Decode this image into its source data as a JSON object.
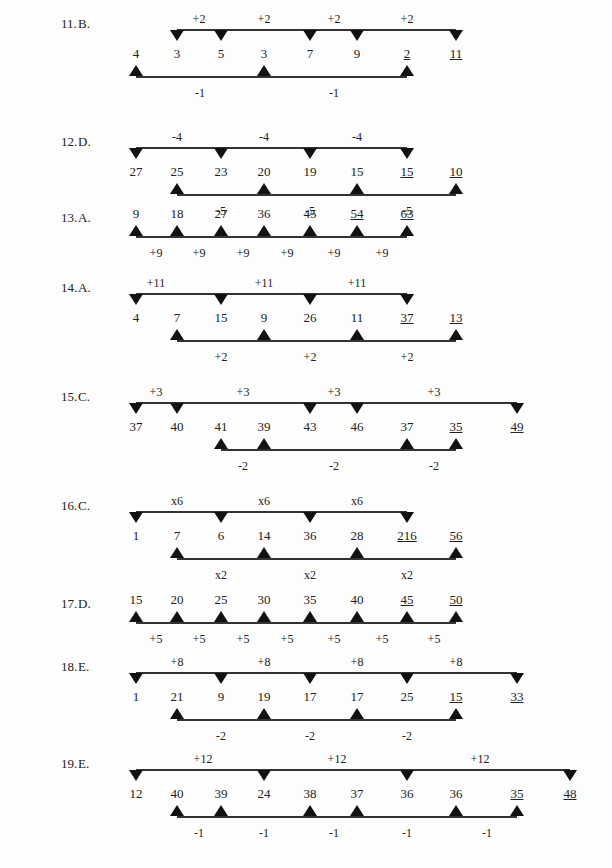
{
  "problems": [
    {
      "number": "11.",
      "answer": "B.",
      "y_top": 12,
      "sequence": [
        {
          "v": "4",
          "x": 136
        },
        {
          "v": "3",
          "x": 177
        },
        {
          "v": "5",
          "x": 221
        },
        {
          "v": "3",
          "x": 264
        },
        {
          "v": "7",
          "x": 310
        },
        {
          "v": "9",
          "x": 357
        },
        {
          "v": "2",
          "x": 407,
          "u": true
        },
        {
          "v": "11",
          "x": 456,
          "u": true
        }
      ],
      "top_line": {
        "x1": 177,
        "x2": 456,
        "markers": [
          177,
          221,
          310,
          357,
          456
        ],
        "labels": [
          {
            "t": "+2",
            "x": 199
          },
          {
            "t": "+2",
            "x": 264
          },
          {
            "t": "+2",
            "x": 334
          },
          {
            "t": "+2",
            "x": 407
          }
        ]
      },
      "bottom_line": {
        "x1": 136,
        "x2": 407,
        "markers": [
          136,
          264,
          407
        ],
        "labels": [
          {
            "t": "-1",
            "x": 200
          },
          {
            "t": "-1",
            "x": 334
          }
        ]
      }
    },
    {
      "number": "12.",
      "answer": "D.",
      "y_top": 130,
      "sequence": [
        {
          "v": "27",
          "x": 136
        },
        {
          "v": "25",
          "x": 177
        },
        {
          "v": "23",
          "x": 221
        },
        {
          "v": "20",
          "x": 264
        },
        {
          "v": "19",
          "x": 310
        },
        {
          "v": "15",
          "x": 357
        },
        {
          "v": "15",
          "x": 407,
          "u": true
        },
        {
          "v": "10",
          "x": 456,
          "u": true
        }
      ],
      "top_line": {
        "x1": 136,
        "x2": 407,
        "markers": [
          136,
          221,
          310,
          407
        ],
        "labels": [
          {
            "t": "-4",
            "x": 177
          },
          {
            "t": "-4",
            "x": 264
          },
          {
            "t": "-4",
            "x": 357
          }
        ]
      },
      "bottom_line": {
        "x1": 177,
        "x2": 456,
        "markers": [
          177,
          264,
          357,
          456
        ],
        "labels": [
          {
            "t": "-5",
            "x": 221
          },
          {
            "t": "-5",
            "x": 310
          },
          {
            "t": "-5",
            "x": 407
          }
        ]
      }
    },
    {
      "number": "13.",
      "answer": "A.",
      "y_top": 206,
      "simple": true,
      "sequence": [
        {
          "v": "9",
          "x": 136
        },
        {
          "v": "18",
          "x": 177
        },
        {
          "v": "27",
          "x": 221
        },
        {
          "v": "36",
          "x": 264
        },
        {
          "v": "45",
          "x": 310
        },
        {
          "v": "54",
          "x": 357,
          "u": true
        },
        {
          "v": "63",
          "x": 407,
          "u": true
        }
      ],
      "bottom_line": {
        "x1": 136,
        "x2": 407,
        "markers": [
          136,
          177,
          221,
          264,
          310,
          357,
          407
        ],
        "labels": [
          {
            "t": "+9",
            "x": 156
          },
          {
            "t": "+9",
            "x": 199
          },
          {
            "t": "+9",
            "x": 243
          },
          {
            "t": "+9",
            "x": 287
          },
          {
            "t": "+9",
            "x": 334
          },
          {
            "t": "+9",
            "x": 382
          }
        ]
      }
    },
    {
      "number": "14.",
      "answer": "A.",
      "y_top": 276,
      "sequence": [
        {
          "v": "4",
          "x": 136
        },
        {
          "v": "7",
          "x": 177
        },
        {
          "v": "15",
          "x": 221
        },
        {
          "v": "9",
          "x": 264
        },
        {
          "v": "26",
          "x": 310
        },
        {
          "v": "11",
          "x": 357
        },
        {
          "v": "37",
          "x": 407,
          "u": true
        },
        {
          "v": "13",
          "x": 456,
          "u": true
        }
      ],
      "top_line": {
        "x1": 136,
        "x2": 407,
        "markers": [
          136,
          221,
          310,
          407
        ],
        "labels": [
          {
            "t": "+11",
            "x": 156
          },
          {
            "t": "+11",
            "x": 264
          },
          {
            "t": "+11",
            "x": 357
          }
        ]
      },
      "bottom_line": {
        "x1": 177,
        "x2": 456,
        "markers": [
          177,
          264,
          357,
          456
        ],
        "labels": [
          {
            "t": "+2",
            "x": 221
          },
          {
            "t": "+2",
            "x": 310
          },
          {
            "t": "+2",
            "x": 407
          }
        ]
      }
    },
    {
      "number": "15.",
      "answer": "C.",
      "y_top": 385,
      "sequence": [
        {
          "v": "37",
          "x": 136
        },
        {
          "v": "40",
          "x": 177
        },
        {
          "v": "41",
          "x": 221
        },
        {
          "v": "39",
          "x": 264
        },
        {
          "v": "43",
          "x": 310
        },
        {
          "v": "46",
          "x": 357
        },
        {
          "v": "37",
          "x": 407
        },
        {
          "v": "35",
          "x": 456,
          "u": true
        },
        {
          "v": "49",
          "x": 517,
          "u": true
        }
      ],
      "top_line": {
        "x1": 136,
        "x2": 517,
        "markers": [
          136,
          177,
          310,
          357,
          517
        ],
        "labels": [
          {
            "t": "+3",
            "x": 156
          },
          {
            "t": "+3",
            "x": 243
          },
          {
            "t": "+3",
            "x": 334
          },
          {
            "t": "+3",
            "x": 434
          }
        ]
      },
      "bottom_line": {
        "x1": 221,
        "x2": 456,
        "markers": [
          221,
          264,
          407,
          456
        ],
        "labels": [
          {
            "t": "-2",
            "x": 243
          },
          {
            "t": "-2",
            "x": 334
          },
          {
            "t": "-2",
            "x": 434
          }
        ]
      }
    },
    {
      "number": "16.",
      "answer": "C.",
      "y_top": 494,
      "sequence": [
        {
          "v": "1",
          "x": 136
        },
        {
          "v": "7",
          "x": 177
        },
        {
          "v": "6",
          "x": 221
        },
        {
          "v": "14",
          "x": 264
        },
        {
          "v": "36",
          "x": 310
        },
        {
          "v": "28",
          "x": 357
        },
        {
          "v": "216",
          "x": 407,
          "u": true
        },
        {
          "v": "56",
          "x": 456,
          "u": true
        }
      ],
      "top_line": {
        "x1": 136,
        "x2": 407,
        "markers": [
          136,
          221,
          310,
          407
        ],
        "labels": [
          {
            "t": "x6",
            "x": 177
          },
          {
            "t": "x6",
            "x": 264
          },
          {
            "t": "x6",
            "x": 357
          }
        ]
      },
      "bottom_line": {
        "x1": 177,
        "x2": 456,
        "markers": [
          177,
          264,
          357,
          456
        ],
        "labels": [
          {
            "t": "x2",
            "x": 221
          },
          {
            "t": "x2",
            "x": 310
          },
          {
            "t": "x2",
            "x": 407
          }
        ]
      }
    },
    {
      "number": "17.",
      "answer": "D.",
      "y_top": 592,
      "simple": true,
      "sequence": [
        {
          "v": "15",
          "x": 136
        },
        {
          "v": "20",
          "x": 177
        },
        {
          "v": "25",
          "x": 221
        },
        {
          "v": "30",
          "x": 264
        },
        {
          "v": "35",
          "x": 310
        },
        {
          "v": "40",
          "x": 357
        },
        {
          "v": "45",
          "x": 407,
          "u": true
        },
        {
          "v": "50",
          "x": 456,
          "u": true
        }
      ],
      "bottom_line": {
        "x1": 136,
        "x2": 456,
        "markers": [
          136,
          177,
          221,
          264,
          310,
          357,
          407,
          456
        ],
        "labels": [
          {
            "t": "+5",
            "x": 156
          },
          {
            "t": "+5",
            "x": 199
          },
          {
            "t": "+5",
            "x": 243
          },
          {
            "t": "+5",
            "x": 287
          },
          {
            "t": "+5",
            "x": 334
          },
          {
            "t": "+5",
            "x": 382
          },
          {
            "t": "+5",
            "x": 434
          }
        ]
      }
    },
    {
      "number": "18.",
      "answer": "E.",
      "y_top": 655,
      "sequence": [
        {
          "v": "1",
          "x": 136
        },
        {
          "v": "21",
          "x": 177
        },
        {
          "v": "9",
          "x": 221
        },
        {
          "v": "19",
          "x": 264
        },
        {
          "v": "17",
          "x": 310
        },
        {
          "v": "17",
          "x": 357
        },
        {
          "v": "25",
          "x": 407
        },
        {
          "v": "15",
          "x": 456,
          "u": true
        },
        {
          "v": "33",
          "x": 517,
          "u": true
        }
      ],
      "top_line": {
        "x1": 136,
        "x2": 517,
        "markers": [
          136,
          221,
          310,
          407,
          517
        ],
        "labels": [
          {
            "t": "+8",
            "x": 177
          },
          {
            "t": "+8",
            "x": 264
          },
          {
            "t": "+8",
            "x": 357
          },
          {
            "t": "+8",
            "x": 456
          }
        ]
      },
      "bottom_line": {
        "x1": 177,
        "x2": 456,
        "markers": [
          177,
          264,
          357,
          456
        ],
        "labels": [
          {
            "t": "-2",
            "x": 221
          },
          {
            "t": "-2",
            "x": 310
          },
          {
            "t": "-2",
            "x": 407
          }
        ]
      }
    },
    {
      "number": "19.",
      "answer": "E.",
      "y_top": 752,
      "sequence": [
        {
          "v": "12",
          "x": 136
        },
        {
          "v": "40",
          "x": 177
        },
        {
          "v": "39",
          "x": 221
        },
        {
          "v": "24",
          "x": 264
        },
        {
          "v": "38",
          "x": 310
        },
        {
          "v": "37",
          "x": 357
        },
        {
          "v": "36",
          "x": 407
        },
        {
          "v": "36",
          "x": 456
        },
        {
          "v": "35",
          "x": 517,
          "u": true
        },
        {
          "v": "48",
          "x": 570,
          "u": true
        }
      ],
      "top_line": {
        "x1": 136,
        "x2": 570,
        "markers": [
          136,
          264,
          407,
          570
        ],
        "labels": [
          {
            "t": "+12",
            "x": 203
          },
          {
            "t": "+12",
            "x": 337
          },
          {
            "t": "+12",
            "x": 480
          }
        ]
      },
      "bottom_line": {
        "x1": 177,
        "x2": 517,
        "markers": [
          177,
          221,
          310,
          357,
          456,
          517
        ],
        "labels": [
          {
            "t": "-1",
            "x": 199
          },
          {
            "t": "-1",
            "x": 264
          },
          {
            "t": "-1",
            "x": 334
          },
          {
            "t": "-1",
            "x": 407
          },
          {
            "t": "-1",
            "x": 487
          }
        ]
      }
    }
  ]
}
